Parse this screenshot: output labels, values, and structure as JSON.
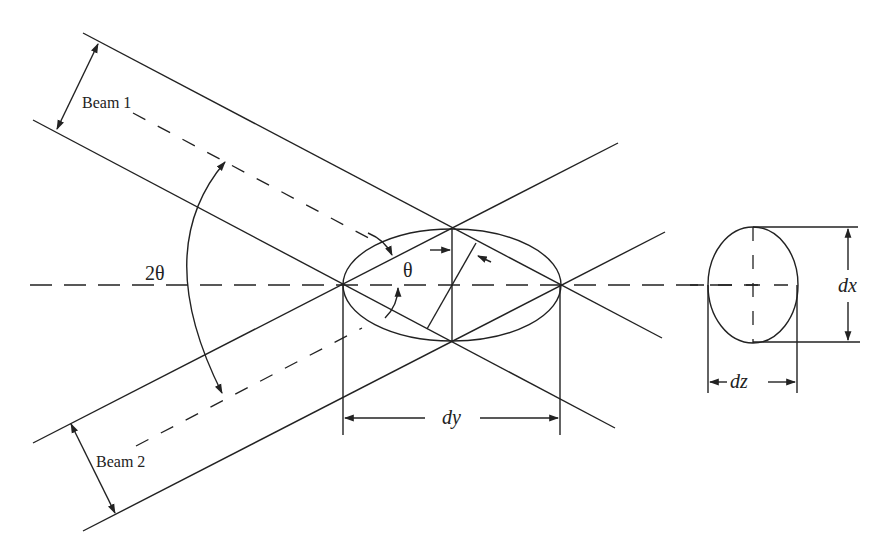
{
  "figure": {
    "labels": {
      "beam1": "Beam 1",
      "beam2": "Beam 2",
      "two_theta": "2θ",
      "theta": "θ",
      "dy": "dy",
      "dx": "dx",
      "dz": "dz"
    },
    "colors": {
      "stroke": "#222222",
      "background": "#ffffff"
    }
  }
}
